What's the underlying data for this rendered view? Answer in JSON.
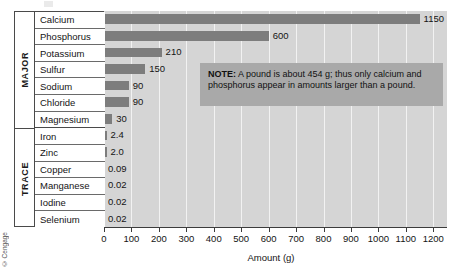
{
  "chart_data": {
    "type": "bar",
    "orientation": "horizontal",
    "title": "",
    "xlabel": "Amount (g)",
    "ylabel": "",
    "xlim": [
      0,
      1250
    ],
    "xticks": [
      0,
      100,
      200,
      300,
      400,
      500,
      600,
      700,
      800,
      900,
      1000,
      1100,
      1200
    ],
    "xtick_labels": [
      "0",
      "100",
      "200",
      "300",
      "400",
      "500",
      "600",
      "700",
      "800",
      "900",
      "1000",
      "1100",
      "1200"
    ],
    "grid": true,
    "grid_axis": "x",
    "legend": false,
    "categories": [
      "Calcium",
      "Phosphorus",
      "Potassium",
      "Sulfur",
      "Sodium",
      "Chloride",
      "Magnesium",
      "Iron",
      "Zinc",
      "Copper",
      "Manganese",
      "Iodine",
      "Selenium"
    ],
    "values": [
      1150,
      600,
      210,
      150,
      90,
      90,
      30,
      2.4,
      2.0,
      0.09,
      0.02,
      0.02,
      0.02
    ],
    "value_labels": [
      "1150",
      "600",
      "210",
      "150",
      "90",
      "90",
      "30",
      "2.4",
      "2.0",
      "0.09",
      "0.02",
      "0.02",
      "0.02"
    ],
    "groups": [
      {
        "label": "MAJOR",
        "categories": [
          "Calcium",
          "Phosphorus",
          "Potassium",
          "Sulfur",
          "Sodium",
          "Chloride",
          "Magnesium"
        ]
      },
      {
        "label": "TRACE",
        "categories": [
          "Iron",
          "Zinc",
          "Copper",
          "Manganese",
          "Iodine",
          "Selenium"
        ]
      }
    ],
    "annotations": [
      {
        "name": "note",
        "prefix": "NOTE:",
        "text": " A pound is about 454 g; thus only calcium and phosphorus appear in amounts larger than a pound."
      }
    ],
    "colors": {
      "bar": "#7d7d7d",
      "plot_background": "#d5d5d5",
      "gridline": "#f2f2f2",
      "note_background": "#a9a9a9",
      "axis": "#3c3c3c",
      "table_border": "#4a4a4a",
      "text": "#141414"
    }
  },
  "credit": "© Cengage"
}
